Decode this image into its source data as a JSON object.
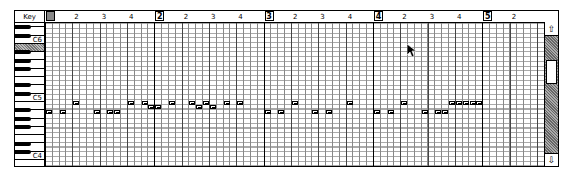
{
  "key_header": "Key",
  "ruler": {
    "measures": [
      {
        "label": "1",
        "x": 0
      },
      {
        "label": "2",
        "x": 109
      },
      {
        "label": "3",
        "x": 218
      },
      {
        "label": "4",
        "x": 327
      },
      {
        "label": "5",
        "x": 436
      }
    ],
    "beats": [
      "2",
      "3",
      "4"
    ]
  },
  "keyboard": {
    "labels": {
      "c6": "C6",
      "c5": "C5",
      "c4": "C4"
    },
    "highlighted_key": "B5"
  },
  "notes": [
    {
      "step": 0,
      "pitch": "C5"
    },
    {
      "step": 2,
      "pitch": "C5"
    },
    {
      "step": 4,
      "pitch": "E5"
    },
    {
      "step": 7,
      "pitch": "C5"
    },
    {
      "step": 9,
      "pitch": "C5"
    },
    {
      "step": 10,
      "pitch": "C5"
    },
    {
      "step": 12,
      "pitch": "E5"
    },
    {
      "step": 14,
      "pitch": "E5"
    },
    {
      "step": 15,
      "pitch": "D5"
    },
    {
      "step": 16,
      "pitch": "D5"
    },
    {
      "step": 18,
      "pitch": "E5"
    },
    {
      "step": 21,
      "pitch": "E5"
    },
    {
      "step": 22,
      "pitch": "D5"
    },
    {
      "step": 23,
      "pitch": "E5"
    },
    {
      "step": 24,
      "pitch": "D5"
    },
    {
      "step": 26,
      "pitch": "E5"
    },
    {
      "step": 28,
      "pitch": "E5"
    },
    {
      "step": 32,
      "pitch": "C5"
    },
    {
      "step": 34,
      "pitch": "C5"
    },
    {
      "step": 36,
      "pitch": "E5"
    },
    {
      "step": 39,
      "pitch": "C5"
    },
    {
      "step": 41,
      "pitch": "C5"
    },
    {
      "step": 44,
      "pitch": "E5"
    },
    {
      "step": 48,
      "pitch": "C5"
    },
    {
      "step": 50,
      "pitch": "C5"
    },
    {
      "step": 52,
      "pitch": "E5"
    },
    {
      "step": 55,
      "pitch": "C5"
    },
    {
      "step": 57,
      "pitch": "C5"
    },
    {
      "step": 58,
      "pitch": "C5"
    },
    {
      "step": 59,
      "pitch": "E5"
    },
    {
      "step": 60,
      "pitch": "E5"
    },
    {
      "step": 61,
      "pitch": "E5"
    },
    {
      "step": 62,
      "pitch": "E5"
    },
    {
      "step": 63,
      "pitch": "E5"
    }
  ],
  "scrollbar": {
    "up_icon": "⇧",
    "down_icon": "⇩"
  }
}
